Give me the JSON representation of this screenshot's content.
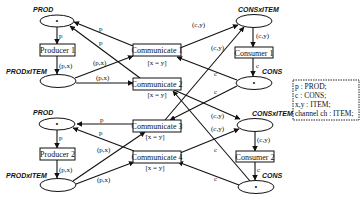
{
  "colors": {
    "ink": "#111111",
    "background": "#ffffff"
  },
  "places": {
    "prod1": {
      "label": "PROD",
      "token": "•"
    },
    "prodxitem1": {
      "label": "PRODxITEM",
      "token": ""
    },
    "consxitem1": {
      "label": "CONSxITEM",
      "token": ""
    },
    "cons1": {
      "label": "CONS",
      "token": "•"
    },
    "prod2": {
      "label": "PROD",
      "token": "•"
    },
    "prodxitem2": {
      "label": "PRODxITEM",
      "token": ""
    },
    "consxitem2": {
      "label": "CONSxITEM",
      "token": ""
    },
    "cons2": {
      "label": "CONS",
      "token": "•"
    }
  },
  "transitions": {
    "producer1": {
      "label": "Producer 1"
    },
    "producer2": {
      "label": "Producer 2"
    },
    "consumer1": {
      "label": "Consumer 1"
    },
    "consumer2": {
      "label": "Consumer 2"
    },
    "communicate1": {
      "label": "Communicate 1",
      "guard": "[x = y]"
    },
    "communicate2": {
      "label": "Communicate 2",
      "guard": "[x = y]"
    },
    "communicate3": {
      "label": "Communicate 3",
      "guard": "[x = y]"
    },
    "communicate4": {
      "label": "Communicate 4",
      "guard": "[x = y]"
    }
  },
  "arc_labels": {
    "prod1_to_producer1": "p",
    "producer1_to_prodxitem1": "(p,x)",
    "comm1_to_prod1": "p",
    "comm2_to_prod1": "p",
    "prodxitem1_to_comm1": "(p,x)",
    "prodxitem1_to_comm2": "(p,x)",
    "comm1_to_consxitem1": "(c,y)",
    "comm3_to_consxitem1": "(c,y)",
    "consxitem1_to_consumer1": "(c,y)",
    "consumer1_to_cons1": "c",
    "cons1_to_comm1": "c",
    "cons1_to_comm3": "c",
    "comm3_to_prod2": "p",
    "comm4_to_prod2": "p",
    "prod2_to_producer2": "p",
    "producer2_to_prodxitem2": "(p,x)",
    "prodxitem2_to_comm3": "(p,x)",
    "prodxitem2_to_comm4": "(p,x)",
    "comm2_to_consxitem2": "(c,y)",
    "comm4_to_consxitem2": "(c,y)",
    "consxitem2_to_consumer2": "(c,y)",
    "consumer2_to_cons2": "c",
    "cons2_to_comm2": "c",
    "cons2_to_comm4": "c"
  },
  "declarations": [
    "p : PROD;",
    "c : CONS;",
    "x,y : ITEM;",
    "channel ch : ITEM;"
  ]
}
